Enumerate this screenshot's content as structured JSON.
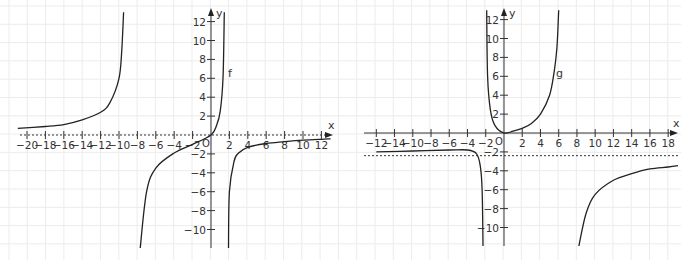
{
  "chart_data": [
    {
      "type": "line",
      "title": "",
      "function_label": "f",
      "xlabel": "x",
      "ylabel": "y",
      "origin_label": "O",
      "xlim": [
        -21,
        13
      ],
      "ylim": [
        -12,
        13
      ],
      "grid": true,
      "x_ticks": [
        -20,
        -18,
        -16,
        -14,
        -12,
        -10,
        -8,
        -6,
        -4,
        -2,
        2,
        4,
        6,
        8,
        10,
        12
      ],
      "x_tick_labels": [
        "−20",
        "−18",
        "−16",
        "−14",
        "−12",
        "−10",
        "−8",
        "−6",
        "−4",
        "−2",
        "2",
        "4",
        "6",
        "8",
        "10",
        "12"
      ],
      "y_ticks": [
        12,
        10,
        8,
        6,
        4,
        2,
        -2,
        -4,
        -6,
        -8,
        -10
      ],
      "y_tick_labels": [
        "12",
        "10",
        "8",
        "6",
        "4",
        "2",
        "−2",
        "−4",
        "−6",
        "−8",
        "−10"
      ],
      "asymptotes": {
        "horizontal": [
          0
        ],
        "vertical_approx": [
          -9.3,
          1.6
        ]
      },
      "series": [
        {
          "name": "f (left branch)",
          "points": [
            [
              -21,
              0.7
            ],
            [
              -18,
              0.9
            ],
            [
              -16,
              1.1
            ],
            [
              -14,
              1.6
            ],
            [
              -12,
              2.4
            ],
            [
              -11,
              3.4
            ],
            [
              -10,
              6
            ],
            [
              -9.7,
              9
            ],
            [
              -9.5,
              13
            ]
          ]
        },
        {
          "name": "f (middle branch)",
          "points": [
            [
              -7.7,
              -12
            ],
            [
              -7,
              -6
            ],
            [
              -6,
              -3.5
            ],
            [
              -4,
              -1.9
            ],
            [
              -2,
              -1
            ],
            [
              0,
              0
            ],
            [
              0.6,
              1
            ],
            [
              1,
              2.5
            ],
            [
              1.3,
              6
            ],
            [
              1.45,
              13
            ]
          ]
        },
        {
          "name": "f (right branch)",
          "points": [
            [
              1.9,
              -12
            ],
            [
              2.0,
              -6
            ],
            [
              2.5,
              -2.8
            ],
            [
              3,
              -1.9
            ],
            [
              4,
              -1.3
            ],
            [
              6,
              -0.9
            ],
            [
              8,
              -0.7
            ],
            [
              10,
              -0.55
            ],
            [
              12,
              -0.45
            ],
            [
              13,
              -0.4
            ]
          ]
        }
      ]
    },
    {
      "type": "line",
      "title": "",
      "function_label": "g",
      "xlabel": "x",
      "ylabel": "y",
      "origin_label": "O",
      "xlim": [
        -14,
        19.5
      ],
      "ylim": [
        -12,
        13
      ],
      "grid": true,
      "x_ticks": [
        -12,
        -14,
        -10,
        -8,
        -6,
        -4,
        -2,
        2,
        4,
        6,
        8,
        10,
        12,
        14,
        16,
        18
      ],
      "x_tick_labels": [
        "−12",
        "−14",
        "−10",
        "−8",
        "−6",
        "−4",
        "−2",
        "2",
        "4",
        "6",
        "8",
        "10",
        "12",
        "14",
        "16",
        "18"
      ],
      "y_ticks": [
        12,
        10,
        8,
        6,
        4,
        2,
        -2,
        -4,
        -6,
        -8,
        -10
      ],
      "y_tick_labels": [
        "12",
        "10",
        "8",
        "6",
        "4",
        "2",
        "−2",
        "−4",
        "−6",
        "−8",
        "−10"
      ],
      "asymptotes": {
        "horizontal": [
          -2.4
        ],
        "vertical_approx": [
          -2.2,
          6.2
        ]
      },
      "series": [
        {
          "name": "g (left branch)",
          "points": [
            [
              -14,
              -2
            ],
            [
              -10,
              -1.9
            ],
            [
              -6,
              -1.8
            ],
            [
              -4,
              -1.8
            ],
            [
              -3,
              -2.2
            ],
            [
              -2.6,
              -3.5
            ],
            [
              -2.4,
              -6
            ],
            [
              -2.3,
              -12
            ]
          ]
        },
        {
          "name": "g (middle branch)",
          "points": [
            [
              -1.9,
              13
            ],
            [
              -1.8,
              6
            ],
            [
              -1.5,
              2.5
            ],
            [
              -1,
              0.8
            ],
            [
              0,
              0
            ],
            [
              1,
              0.2
            ],
            [
              2,
              0.5
            ],
            [
              3,
              1
            ],
            [
              4,
              2
            ],
            [
              5,
              4
            ],
            [
              5.5,
              6.5
            ],
            [
              5.8,
              9
            ],
            [
              6,
              13
            ]
          ]
        },
        {
          "name": "g (right branch)",
          "points": [
            [
              8.2,
              -12
            ],
            [
              9,
              -8.5
            ],
            [
              10,
              -6.5
            ],
            [
              12,
              -5
            ],
            [
              14,
              -4.3
            ],
            [
              16,
              -3.8
            ],
            [
              18,
              -3.6
            ],
            [
              19.5,
              -3.4
            ]
          ]
        }
      ]
    }
  ],
  "graphs": [
    {
      "function_label": "f",
      "x_axis_label": "x",
      "y_axis_label": "y",
      "origin_label": "O"
    },
    {
      "function_label": "g",
      "x_axis_label": "x",
      "y_axis_label": "y",
      "origin_label": "O"
    }
  ]
}
